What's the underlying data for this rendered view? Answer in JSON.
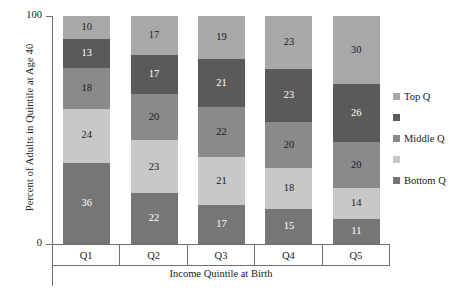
{
  "chart_data": {
    "type": "bar",
    "subtype": "stacked-100-percent",
    "title": "",
    "xlabel": "Income Quintile at Birth",
    "ylabel": "Percent of Adults in Quintile at Age 40",
    "categories": [
      "Q1",
      "Q2",
      "Q3",
      "Q4",
      "Q5"
    ],
    "ylim": [
      0,
      100
    ],
    "ytick_labels": [
      "0",
      "100"
    ],
    "grid": false,
    "legend_position": "right",
    "stack_order": "top-to-bottom",
    "series": [
      {
        "name": "Top Q",
        "legend_label": "Top Q",
        "color": "#a8a8a8",
        "label_color": "#1a1a1a",
        "values": [
          10,
          17,
          19,
          23,
          30
        ]
      },
      {
        "name": "Fourth Q",
        "legend_label": "",
        "color": "#5a5a5a",
        "label_color": "#ffffff",
        "values": [
          13,
          17,
          21,
          23,
          26
        ]
      },
      {
        "name": "Middle Q",
        "legend_label": "Middle Q",
        "color": "#8a8a8a",
        "label_color": "#1a1a1a",
        "values": [
          18,
          20,
          22,
          20,
          20
        ]
      },
      {
        "name": "Second Q",
        "legend_label": "",
        "color": "#c8c8c8",
        "label_color": "#1a1a1a",
        "values": [
          24,
          23,
          21,
          18,
          14
        ]
      },
      {
        "name": "Bottom Q",
        "legend_label": "Bottom Q",
        "color": "#767676",
        "label_color": "#ffffff",
        "values": [
          36,
          22,
          17,
          15,
          11
        ]
      }
    ]
  },
  "axes": {
    "y_top_tick": "100",
    "y_bottom_tick": "0",
    "y_title": "Percent of Adults in Quintile at Age 40",
    "x_title": "Income Quintile at Birth"
  },
  "legend": {
    "items": [
      {
        "label": "Top Q",
        "color": "#a8a8a8"
      },
      {
        "label": "",
        "color": "#5a5a5a"
      },
      {
        "label": "Middle Q",
        "color": "#8a8a8a"
      },
      {
        "label": "",
        "color": "#c8c8c8"
      },
      {
        "label": "Bottom Q",
        "color": "#767676"
      }
    ]
  }
}
